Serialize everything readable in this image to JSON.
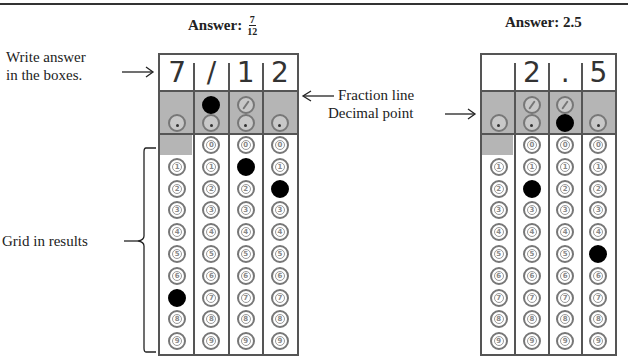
{
  "examples": [
    {
      "title_prefix": "Answer:",
      "title_fraction": {
        "numerator": "7",
        "denominator": "12"
      },
      "title_value": "",
      "answer_boxes": [
        "7",
        "/",
        "1",
        "2"
      ],
      "fraction_row": [
        null,
        "filled",
        "empty",
        null
      ],
      "decimal_row": [
        "empty",
        "empty",
        "empty",
        "empty"
      ],
      "digit_filled": [
        7,
        null,
        1,
        2
      ],
      "has_zero": [
        false,
        true,
        true,
        true
      ]
    },
    {
      "title_prefix": "Answer: 2.5",
      "title_fraction": null,
      "title_value": "",
      "answer_boxes": [
        "",
        "2",
        ".",
        "5"
      ],
      "fraction_row": [
        null,
        "empty",
        "empty",
        null
      ],
      "decimal_row": [
        "empty",
        "empty",
        "filled",
        "empty"
      ],
      "digit_filled": [
        null,
        2,
        null,
        5
      ],
      "has_zero": [
        false,
        true,
        true,
        true
      ]
    }
  ],
  "labels": {
    "write_answer_line1": "Write answer",
    "write_answer_line2": "in the boxes.",
    "fraction_line": "Fraction line",
    "decimal_point": "Decimal point",
    "grid_in_results": "Grid in results"
  },
  "digits": [
    "0",
    "1",
    "2",
    "3",
    "4",
    "5",
    "6",
    "7",
    "8",
    "9"
  ],
  "colors": {
    "shade": "#b5b5b5",
    "border": "#555555",
    "filled": "#000000"
  }
}
